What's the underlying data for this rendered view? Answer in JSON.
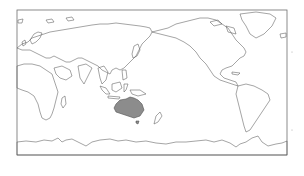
{
  "map": {
    "projection": "equirectangular",
    "central_longitude": 150,
    "highlighted_region": "Australia",
    "colors": {
      "background": "#ffffff",
      "outline": "#5a5a5a",
      "highlight_fill": "#8c8c8c",
      "frame": "#6e6e6e"
    },
    "frame": {
      "x": 17,
      "y": 10,
      "width": 270,
      "height": 145
    }
  }
}
